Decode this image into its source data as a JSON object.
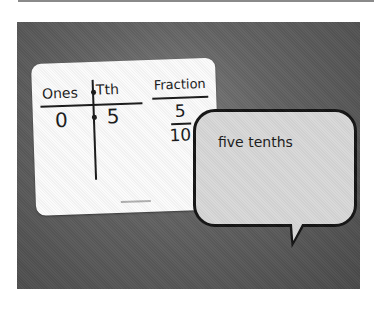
{
  "image": {
    "description": "Photo of a whiteboard place-value card next to a speech bubble, on a dark gray background",
    "colors": {
      "background": "#5e5e5e",
      "card": "#fbfbfb",
      "bubble": "#d8d8d8",
      "ink": "#1a1a1a"
    }
  },
  "card": {
    "headers": {
      "ones": "Ones",
      "tenths": "Tth",
      "fraction": "Fraction"
    },
    "values": {
      "ones": "0",
      "tenths": "5"
    },
    "fraction": {
      "numerator": "5",
      "denominator": "10"
    }
  },
  "bubble": {
    "text": "five tenths"
  }
}
